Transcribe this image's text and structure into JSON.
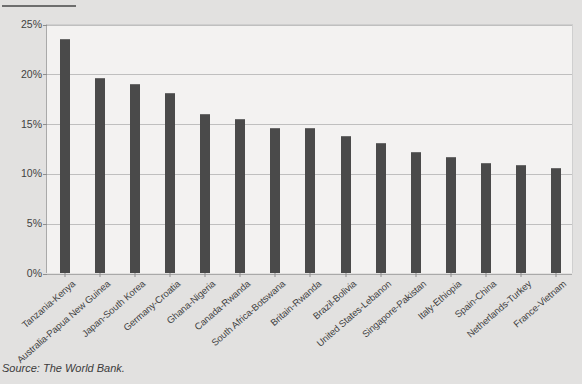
{
  "source_note": "Source: The World Bank.",
  "chart_data": {
    "type": "bar",
    "title": "",
    "subtitle": "",
    "xlabel": "",
    "ylabel": "",
    "ylim": [
      0,
      25
    ],
    "ytick_labels": [
      "25%",
      "20%",
      "15%",
      "10%",
      "5%",
      "0%"
    ],
    "ytick_values": [
      25,
      20,
      15,
      10,
      5,
      0
    ],
    "grid": true,
    "legend": false,
    "bar_color": "#4a4a4a",
    "plot_background": "#f3f2f1",
    "page_background": "#e2e1e0",
    "categories": [
      "Tanzania-Kenya",
      "Australia-Papua New Guinea",
      "Japan-South Korea",
      "Germany-Croatia",
      "Ghana-Nigeria",
      "Canada-Rwanda",
      "South Africa-Botswana",
      "Britain-Rwanda",
      "Brazil-Bolivia",
      "United States-Lebanon",
      "Singapore-Pakistan",
      "Italy-Ethiopia",
      "Spain-China",
      "Netherlands-Turkey",
      "France-Vietnam"
    ],
    "values": [
      23.5,
      19.6,
      19.0,
      18.1,
      16.0,
      15.5,
      14.6,
      14.6,
      13.8,
      13.1,
      12.2,
      11.6,
      11.0,
      10.8,
      10.5
    ]
  }
}
